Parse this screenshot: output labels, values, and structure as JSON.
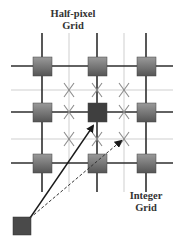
{
  "labels": {
    "half_pixel_line1": "Half-pixel",
    "half_pixel_line2": "Grid",
    "integer_line1": "Integer",
    "integer_line2": "Grid"
  },
  "colors": {
    "thick_line": "#333333",
    "thin_line": "#c8c8c8",
    "square_top": "#8a8a8a",
    "square_bottom": "#5a5a5a",
    "selected_square": "#3f3f3f",
    "x_mark": "#8c8c8c",
    "arrow": "#1a1a1a"
  },
  "grid": {
    "integer_columns_x": [
      42,
      97,
      146
    ],
    "integer_rows_y": [
      66,
      112,
      163
    ],
    "half_columns_x": [
      69,
      124
    ],
    "half_rows_y": [
      90,
      139
    ],
    "half_pixel_points": [
      [
        69,
        90
      ],
      [
        97,
        90
      ],
      [
        124,
        90
      ],
      [
        69,
        112
      ],
      [
        124,
        112
      ],
      [
        69,
        139
      ],
      [
        97,
        139
      ],
      [
        124,
        139
      ]
    ],
    "selected_integer_point": [
      97,
      112
    ],
    "origin_block": [
      22,
      226
    ]
  },
  "arrows": [
    {
      "name": "integer-motion-vector",
      "style": "solid",
      "from": [
        30,
        218
      ],
      "to": [
        95,
        124
      ]
    },
    {
      "name": "half-pixel-motion-vector",
      "style": "dashed",
      "from": [
        30,
        218
      ],
      "to": [
        124,
        139
      ]
    }
  ]
}
